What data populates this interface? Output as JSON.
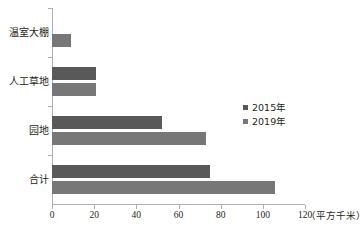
{
  "chart_data": {
    "type": "bar",
    "orientation": "horizontal",
    "title": "",
    "xlabel": "（平方千米）",
    "ylabel": "",
    "unit_label": "（平方千米）",
    "categories": [
      "温室大棚",
      "人工草地",
      "园地",
      "合计"
    ],
    "series": [
      {
        "name": "2015年",
        "color": "#595959",
        "values": [
          0,
          21,
          52,
          75
        ]
      },
      {
        "name": "2019年",
        "color": "#777777",
        "values": [
          9,
          21,
          73,
          106
        ]
      }
    ],
    "xlim": [
      0,
      120
    ],
    "xticks": [
      "0",
      "20",
      "40",
      "60",
      "80",
      "100",
      "120"
    ],
    "xtick_values": [
      0,
      20,
      40,
      60,
      80,
      100,
      120
    ],
    "grid": false,
    "legend_position": "center-right"
  },
  "axis": {
    "tick_0": "0",
    "tick_20": "20",
    "tick_40": "40",
    "tick_60": "60",
    "tick_80": "80",
    "tick_100": "100",
    "tick_120": "120",
    "unit": "（平方千米）"
  },
  "categories": {
    "c0": "温室大棚",
    "c1": "人工草地",
    "c2": "园地",
    "c3": "合计"
  },
  "legend": {
    "items": [
      {
        "label": "2015年"
      },
      {
        "label": "2019年"
      }
    ]
  }
}
